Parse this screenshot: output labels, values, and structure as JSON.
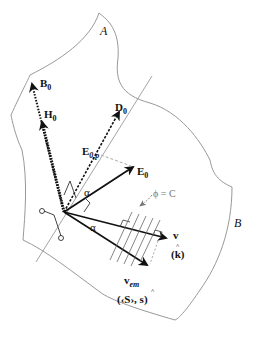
{
  "diagram": {
    "regions": {
      "A": "A",
      "B": "B"
    },
    "vectors": {
      "B0": {
        "main": "B",
        "sub": "0"
      },
      "H0": {
        "main": "H",
        "sub": "0"
      },
      "D0": {
        "main": "D",
        "sub": "0"
      },
      "E0p": {
        "main": "E",
        "sub": "0,p"
      },
      "E0": {
        "main": "E",
        "sub": "0"
      },
      "v": {
        "main": "v"
      },
      "k": {
        "main": "(k)",
        "hat": "^"
      },
      "vem": {
        "main": "v",
        "sub": "em"
      },
      "S": {
        "text": "(‹S›, ",
        "s": "s",
        "close": ")",
        "hat": "^"
      }
    },
    "angle_label_1": "α",
    "angle_label_2": "α",
    "phase_surface": "ϕ = C"
  },
  "colors": {
    "boundary": "#888888",
    "vector": "#111111",
    "dashed": "#999999"
  }
}
